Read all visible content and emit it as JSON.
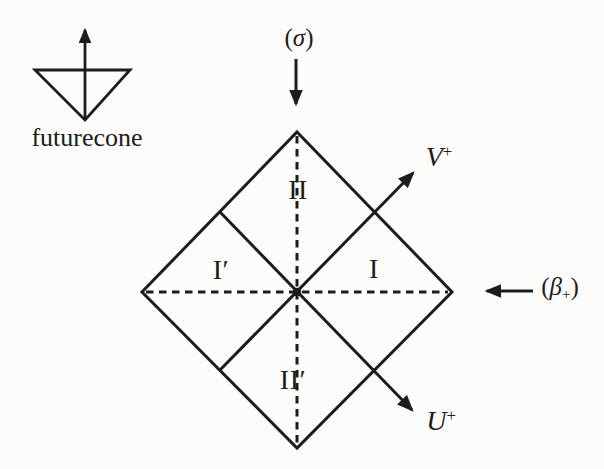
{
  "figure": {
    "background_color": "#fcfcfb",
    "ink_color": "#1c1c1c"
  },
  "legend": {
    "icon": "futurecone-icon",
    "label": "futurecone"
  },
  "top_annotation": {
    "icon": "down-arrow-icon",
    "direction": "down",
    "open": "(",
    "symbol": "σ",
    "close": ")"
  },
  "right_annotation": {
    "icon": "left-arrow-icon",
    "direction": "left",
    "open": "(",
    "symbol": "β",
    "sub": "+",
    "close": ")"
  },
  "axes": {
    "v": {
      "base": "V",
      "sup": "+"
    },
    "u": {
      "base": "U",
      "sup": "+"
    }
  },
  "regions": {
    "top": "II",
    "left": "I′",
    "right": "I",
    "bottom": "II′"
  }
}
